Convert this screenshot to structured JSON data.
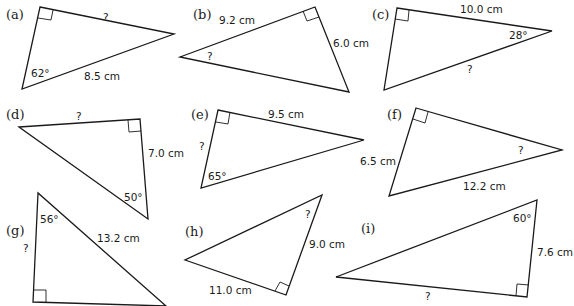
{
  "header_fragment": "…right-angled triangles…",
  "triangles": [
    {
      "id": "a",
      "label": "(a)",
      "angle": "62°",
      "hypotenuse": "8.5 cm",
      "unknown": "?",
      "given": {
        "angle_deg": 62,
        "hypotenuse_cm": 8.5
      },
      "find": "side opposite 62°"
    },
    {
      "id": "b",
      "label": "(b)",
      "side1": "9.2 cm",
      "side2": "6.0 cm",
      "unknown": "?",
      "given": {
        "adjacent_cm": 9.2,
        "opposite_cm": 6.0
      },
      "find": "angle"
    },
    {
      "id": "c",
      "label": "(c)",
      "side": "10.0 cm",
      "angle": "28°",
      "unknown": "?",
      "given": {
        "adjacent_cm": 10.0,
        "angle_deg": 28
      },
      "find": "hypotenuse"
    },
    {
      "id": "d",
      "label": "(d)",
      "side": "7.0 cm",
      "angle": "50°",
      "unknown": "?",
      "given": {
        "adjacent_cm": 7.0,
        "angle_deg": 50
      },
      "find": "opposite side"
    },
    {
      "id": "e",
      "label": "(e)",
      "side": "9.5 cm",
      "angle": "65°",
      "unknown": "?",
      "given": {
        "opposite_cm": 9.5,
        "angle_deg": 65
      },
      "find": "adjacent side"
    },
    {
      "id": "f",
      "label": "(f)",
      "side": "6.5 cm",
      "hypotenuse": "12.2 cm",
      "unknown": "?",
      "given": {
        "opposite_cm": 6.5,
        "hypotenuse_cm": 12.2
      },
      "find": "angle"
    },
    {
      "id": "g",
      "label": "(g)",
      "angle": "56°",
      "hypotenuse": "13.2 cm",
      "unknown": "?",
      "given": {
        "angle_deg": 56,
        "hypotenuse_cm": 13.2
      },
      "find": "adjacent side"
    },
    {
      "id": "h",
      "label": "(h)",
      "side1": "11.0 cm",
      "side2": "9.0 cm",
      "unknown": "?",
      "given": {
        "opposite_cm": 11.0,
        "adjacent_cm": 9.0
      },
      "find": "angle"
    },
    {
      "id": "i",
      "label": "(i)",
      "angle": "60°",
      "side": "7.6 cm",
      "unknown": "?",
      "given": {
        "angle_deg": 60,
        "adjacent_cm": 7.6
      },
      "find": "opposite side"
    }
  ]
}
